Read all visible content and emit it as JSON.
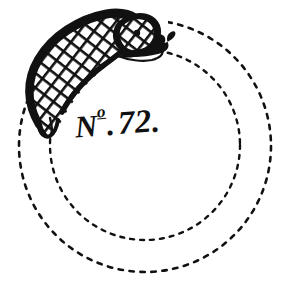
{
  "plate": {
    "title": "No. 72.",
    "inscription": {
      "prefix": "N",
      "superscript": "o",
      "separator": ".",
      "value": "72",
      "terminator": "."
    },
    "ink_color": "#111111",
    "background_color": "#ffffff",
    "medium": "engraving"
  },
  "figure": {
    "body_label": "serpent-body",
    "head_label": "serpent-head",
    "tail_label": "serpent-tail",
    "scale_pattern": "diamond-net"
  },
  "rings": {
    "outer": {
      "label": "outer dashed circle",
      "center_x": 145,
      "center_y": 146,
      "radius": 126,
      "style": "dashed"
    },
    "inner": {
      "label": "inner dashed circle",
      "center_x": 145,
      "center_y": 145,
      "radius": 95,
      "style": "dashed"
    }
  }
}
